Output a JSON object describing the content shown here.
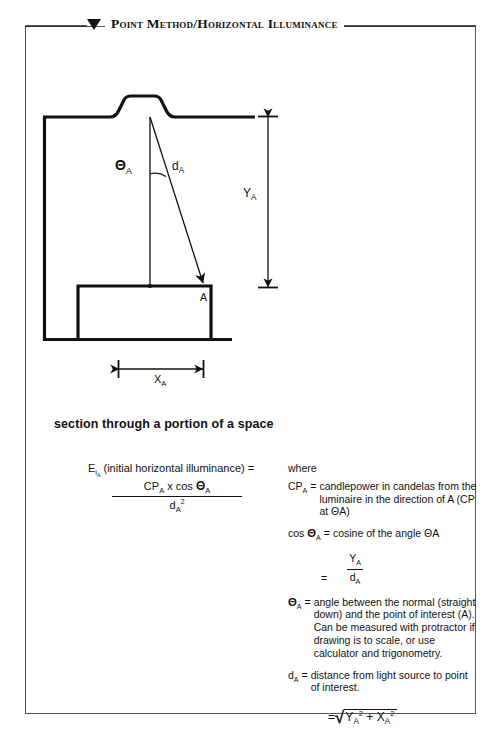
{
  "page": {
    "title": "Point Method/Horizontal Illuminance",
    "marker_icon": "down-triangle-icon",
    "background_color": "#ffffff",
    "ink_color": "#111111",
    "frame_color": "#555555"
  },
  "diagram": {
    "name": "section-through-space-diagram",
    "caption": "section through a portion of a space",
    "labels": {
      "theta": "Θ",
      "theta_sub": "A",
      "distance": "d",
      "distance_sub": "A",
      "vertical_dim": "Y",
      "vertical_dim_sub": "A",
      "horizontal_dim": "X",
      "horizontal_dim_sub": "A",
      "point": "A"
    },
    "elements": [
      "ceiling-line",
      "luminaire-recess",
      "left-wall",
      "floor-line",
      "desk-rectangle",
      "normal-vertical-line",
      "light-ray-diagonal",
      "angle-arc",
      "point-a-arrowhead",
      "y-dimension-line",
      "x-dimension-line"
    ]
  },
  "formula": {
    "name": "illuminance-formula",
    "lead_symbol": "E",
    "lead_sub": "i",
    "lead_sub2": "A",
    "lead_text": "(initial  horizontal  illuminance)  =",
    "numerator_cp": "CP",
    "numerator_cp_sub": "A",
    "numerator_mid": " x cos ",
    "numerator_theta": "Θ",
    "numerator_theta_sub": "A",
    "denominator_d": "d",
    "denominator_sub": "A",
    "denominator_sup": "2"
  },
  "definitions": {
    "where_label": "where",
    "items": [
      {
        "term_base": "CP",
        "term_sub": "A",
        "term_theta": "",
        "equals": "=",
        "body": "candlepower in candelas from the luminaire in the direction of A (CP at ΘA)"
      },
      {
        "term_base": "cos ",
        "term_sub": "A",
        "term_theta": "Θ",
        "equals": "=",
        "body": "cosine of the angle ΘA"
      },
      {
        "term_base": "",
        "term_sub": "A",
        "term_theta": "Θ",
        "equals": "=",
        "body": "angle between the normal (straight down) and the point of interest (A). Can be measured with protractor if drawing is to scale, or use calculator and trigonometry."
      },
      {
        "term_base": "d",
        "term_sub": "A",
        "term_theta": "",
        "equals": "=",
        "body": "distance from light source to point of interest."
      }
    ],
    "cos_fraction": {
      "equals": "=",
      "numerator": "Y",
      "numerator_sub": "A",
      "denominator": "d",
      "denominator_sub": "A"
    },
    "sqrt_expression": {
      "equals": "=",
      "radical": "√",
      "term1": "Y",
      "term1_sub": "A",
      "term1_sup": "2",
      "plus": "+",
      "term2": "X",
      "term2_sub": "A",
      "term2_sup": "2"
    }
  }
}
